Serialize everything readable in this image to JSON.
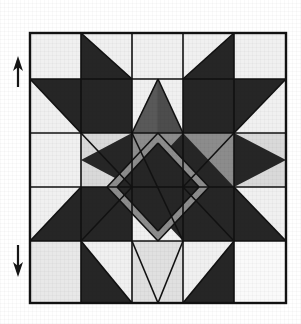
{
  "figure": {
    "title": "Quilt block pattern diagram",
    "kind": "quilt-block-diagram",
    "background_color": "#ffffff"
  },
  "palette": {
    "light": "#f0f0f0",
    "medium": "#8c8c8c",
    "dark": "#262626",
    "outline": "#111111",
    "background": "#ffffff"
  },
  "block": {
    "name": "star-and-diamond-block",
    "left": 30,
    "top": 33,
    "right": 286,
    "bottom": 303,
    "columns": 5,
    "rows": 5,
    "column_edges": [
      30,
      81,
      132,
      183,
      234,
      286
    ],
    "row_edges": [
      33,
      79,
      133,
      187,
      241,
      303
    ],
    "border_width": 2
  },
  "markers": {
    "top_arrow": {
      "label": "up-arrow-marker",
      "direction": "up",
      "x": 18,
      "y_start": 86,
      "y_end": 58
    },
    "bottom_arrow": {
      "label": "down-arrow-marker",
      "direction": "down",
      "x": 18,
      "y_start": 245,
      "y_end": 276
    }
  },
  "patches": [
    {
      "name": "corner-tl-light",
      "shade": "light"
    },
    {
      "name": "top-left-triangle",
      "shade": "dark"
    },
    {
      "name": "top-center-light",
      "shade": "light"
    },
    {
      "name": "top-right-triangle",
      "shade": "dark"
    },
    {
      "name": "corner-tr-light",
      "shade": "light"
    },
    {
      "name": "left-star-point",
      "shade": "dark"
    },
    {
      "name": "center-diamond",
      "shade": "dark"
    },
    {
      "name": "center-field",
      "shade": "medium"
    },
    {
      "name": "right-star-point",
      "shade": "dark"
    },
    {
      "name": "bottom-left-triangle",
      "shade": "dark"
    },
    {
      "name": "bottom-right-triangle",
      "shade": "dark"
    },
    {
      "name": "corner-bl-light",
      "shade": "light"
    },
    {
      "name": "corner-br-light",
      "shade": "light"
    }
  ]
}
